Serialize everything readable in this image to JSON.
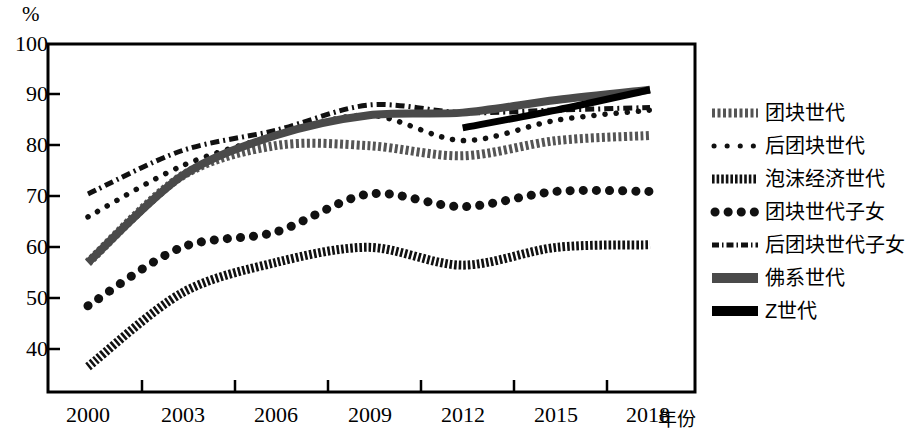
{
  "chart_data": {
    "type": "line",
    "title": "",
    "xlabel": "年份",
    "ylabel": "%",
    "ylim": [
      33,
      100
    ],
    "xlim": [
      2000,
      2018
    ],
    "grid": false,
    "legend_position": "right",
    "y_ticks": [
      "100",
      "90",
      "80",
      "70",
      "60",
      "50",
      "40"
    ],
    "y_tick_values": [
      100,
      90,
      80,
      70,
      60,
      50,
      40
    ],
    "categories": [
      "2000",
      "2003",
      "2006",
      "2009",
      "2012",
      "2015",
      "2018"
    ],
    "x": [
      2000,
      2003,
      2006,
      2009,
      2012,
      2015,
      2018
    ],
    "series": [
      {
        "name": "团块世代",
        "style": "thick-dotted-gray",
        "color": "#555555",
        "x": [
          2000,
          2003,
          2006,
          2009,
          2012,
          2015,
          2018
        ],
        "values": [
          57,
          74,
          80,
          80,
          78,
          81,
          82
        ]
      },
      {
        "name": "后团块世代",
        "style": "fine-dotted",
        "color": "#111111",
        "x": [
          2000,
          2003,
          2006,
          2009,
          2012,
          2015,
          2018
        ],
        "values": [
          66,
          76,
          82,
          86,
          81,
          85,
          87
        ]
      },
      {
        "name": "泡沫经济世代",
        "style": "dense-dashed",
        "color": "#111111",
        "x": [
          2000,
          2003,
          2006,
          2009,
          2012,
          2015,
          2018
        ],
        "values": [
          36.5,
          51,
          57,
          60,
          56.5,
          60,
          60.5
        ]
      },
      {
        "name": "团块世代子女",
        "style": "bold-dotted",
        "color": "#111111",
        "x": [
          2000,
          2003,
          2006,
          2009,
          2012,
          2015,
          2018
        ],
        "values": [
          48.5,
          60,
          63,
          70.5,
          68,
          71,
          71
        ]
      },
      {
        "name": "后团块世代子女",
        "style": "dash-dot",
        "color": "#111111",
        "x": [
          2000,
          2003,
          2006,
          2009,
          2012,
          2015,
          2018
        ],
        "values": [
          70.5,
          79,
          83,
          88,
          86.5,
          87,
          87.5
        ]
      },
      {
        "name": "佛系世代",
        "style": "thick-gray-solid",
        "color": "#4a4a4a",
        "x": [
          2000,
          2003,
          2006,
          2009,
          2012,
          2015,
          2018
        ],
        "values": [
          57,
          74,
          82,
          86,
          86.5,
          89,
          91
        ]
      },
      {
        "name": "Z世代",
        "style": "thick-black-solid",
        "color": "#000000",
        "x": [
          2012,
          2015,
          2018
        ],
        "values": [
          83.5,
          87,
          91
        ]
      }
    ]
  },
  "axis": {
    "unit_label": "%",
    "x_title": "年份"
  },
  "legend": {
    "items": [
      {
        "label": "团块世代"
      },
      {
        "label": "后团块世代"
      },
      {
        "label": "泡沫经济世代"
      },
      {
        "label": "团块世代子女"
      },
      {
        "label": "后团块世代子女"
      },
      {
        "label": "佛系世代"
      },
      {
        "label": "Z世代"
      }
    ]
  }
}
